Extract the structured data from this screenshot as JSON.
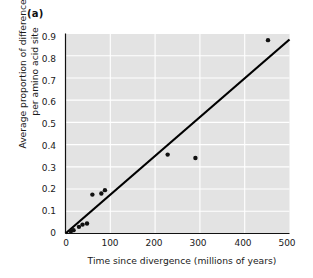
{
  "figure": {
    "panel_label": "(a)"
  },
  "chart_data": {
    "type": "scatter",
    "title": "",
    "panel": "(a)",
    "xlabel": "Time since divergence (millions of years)",
    "ylabel": "Average proportion of differences per amino acid site",
    "ylabel_line1": "Average proportion of differences",
    "ylabel_line2": "per amino acid site",
    "xlim": [
      0,
      500
    ],
    "ylim": [
      0,
      0.9
    ],
    "xticks": [
      0,
      100,
      200,
      300,
      400,
      500
    ],
    "xtick_labels": [
      "0",
      "100",
      "200",
      "300",
      "400",
      "500"
    ],
    "yticks": [
      0,
      0.1,
      0.2,
      0.3,
      0.4,
      0.5,
      0.6,
      0.7,
      0.8,
      0.9
    ],
    "ytick_labels": [
      "0",
      "0.1",
      "0.2",
      "0.3",
      "0.4",
      "0.5",
      "0.6",
      "0.7",
      "0.8",
      "0.9"
    ],
    "grid": true,
    "grid_color": "#ffffff",
    "plot_background": "#e3e3e3",
    "legend": null,
    "points": [
      {
        "x": 12,
        "y": 0.01
      },
      {
        "x": 18,
        "y": 0.015
      },
      {
        "x": 30,
        "y": 0.03
      },
      {
        "x": 38,
        "y": 0.04
      },
      {
        "x": 48,
        "y": 0.045
      },
      {
        "x": 60,
        "y": 0.175
      },
      {
        "x": 80,
        "y": 0.18
      },
      {
        "x": 88,
        "y": 0.195
      },
      {
        "x": 228,
        "y": 0.355
      },
      {
        "x": 290,
        "y": 0.34
      },
      {
        "x": 452,
        "y": 0.87
      }
    ],
    "point_color": "#111111",
    "point_size": 2.2,
    "fit_line": {
      "type": "line",
      "x": [
        0,
        500
      ],
      "y": [
        0.0,
        0.873
      ],
      "slope": 0.001746,
      "intercept": 0.0,
      "color": "#000000",
      "width": 2.2
    }
  }
}
